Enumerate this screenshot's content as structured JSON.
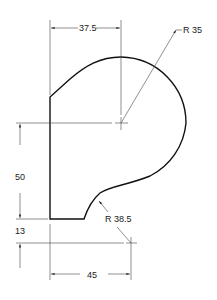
{
  "diagram": {
    "type": "engineering-drawing",
    "dimensions": {
      "top_width": "37.5",
      "upper_radius": "R 35",
      "height": "50",
      "bottom_offset": "13",
      "bottom_width": "45",
      "lower_radius": "R 38.5"
    },
    "colors": {
      "outline": "#111111",
      "dimension_lines": "#444444",
      "background": "#ffffff"
    }
  }
}
